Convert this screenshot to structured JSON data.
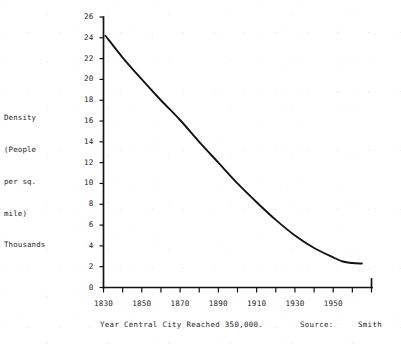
{
  "chart_data": {
    "type": "line",
    "title": "",
    "subtitle": "",
    "xlabel": "Year Central City Reached 350,000.",
    "ylabel": "Density (People per sq. mile) Thousands",
    "ylabel_lines": [
      "Density",
      "(People",
      "per sq.",
      "mile)",
      "Thousands"
    ],
    "xlim": [
      1830,
      1970
    ],
    "ylim": [
      0,
      26
    ],
    "grid": false,
    "legend": null,
    "x_tick_labels": [
      "1830",
      "1850",
      "1870",
      "1890",
      "1910",
      "1930",
      "1950"
    ],
    "x_tick_values": [
      1830,
      1850,
      1870,
      1890,
      1910,
      1930,
      1950
    ],
    "x_minor_tick_values": [
      1830,
      1840,
      1850,
      1860,
      1870,
      1880,
      1890,
      1900,
      1910,
      1920,
      1930,
      1940,
      1950,
      1960,
      1970
    ],
    "y_tick_labels": [
      "0",
      "2",
      "4",
      "6",
      "8",
      "10",
      "12",
      "14",
      "16",
      "18",
      "20",
      "22",
      "24",
      "26"
    ],
    "y_tick_values": [
      0,
      2,
      4,
      6,
      8,
      10,
      12,
      14,
      16,
      18,
      20,
      22,
      24,
      26
    ],
    "series": [
      {
        "name": "Density",
        "x": [
          1831,
          1840,
          1850,
          1860,
          1870,
          1880,
          1890,
          1900,
          1910,
          1920,
          1930,
          1940,
          1950,
          1955,
          1960,
          1965
        ],
        "values": [
          24.2,
          22.1,
          20.0,
          18.0,
          16.1,
          14.0,
          12.0,
          10.0,
          8.2,
          6.5,
          5.0,
          3.8,
          2.9,
          2.5,
          2.35,
          2.3
        ]
      }
    ],
    "annotations": [
      {
        "text": "Source:",
        "position": "below-axis-right"
      },
      {
        "text": "Smith",
        "position": "below-axis-far-right"
      }
    ]
  },
  "caption": {
    "main": "Year Central City Reached 350,000.",
    "source_label": "Source:",
    "source_value": "Smith"
  },
  "colors": {
    "curve": "#141414",
    "axis": "#141414",
    "text": "#262626",
    "background": "#ffffff"
  }
}
